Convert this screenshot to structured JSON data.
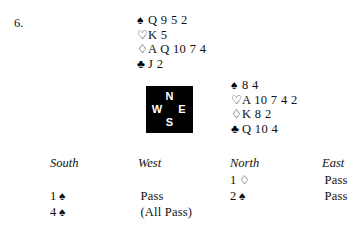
{
  "problem": {
    "number": "6."
  },
  "suits": {
    "spade": "♠",
    "heart": "♡",
    "diamond": "♢",
    "club": "♣"
  },
  "hands": {
    "north": {
      "position_label": "North",
      "rows": [
        {
          "suit_name": "spade-symbol",
          "symbol": "♠",
          "cards": "Q 9 5 2"
        },
        {
          "suit_name": "heart-symbol",
          "symbol": "♡",
          "cards": "K 5"
        },
        {
          "suit_name": "diamond-symbol",
          "symbol": "♢",
          "cards": "A Q 10 7 4"
        },
        {
          "suit_name": "club-symbol",
          "symbol": "♣",
          "cards": "J 2"
        }
      ]
    },
    "east": {
      "position_label": "East",
      "rows": [
        {
          "suit_name": "spade-symbol",
          "symbol": "♠",
          "cards": "8 4"
        },
        {
          "suit_name": "heart-symbol",
          "symbol": "♡",
          "cards": "A 10 7 4 2"
        },
        {
          "suit_name": "diamond-symbol",
          "symbol": "♢",
          "cards": "K 8 2"
        },
        {
          "suit_name": "club-symbol",
          "symbol": "♣",
          "cards": "Q 10 4"
        }
      ]
    }
  },
  "compass": {
    "north": "N",
    "west": "W",
    "east": "E",
    "south": "S",
    "background_color": "#000000",
    "letter_color": "#ffffff"
  },
  "bidding": {
    "headers": {
      "south": "South",
      "west": "West",
      "north": "North",
      "east": "East"
    },
    "rows": [
      {
        "south": {
          "level": "",
          "suit": "",
          "text": ""
        },
        "west": {
          "level": "",
          "suit": "",
          "text": ""
        },
        "north": {
          "level": "1",
          "suit": "♢",
          "text": ""
        },
        "east": {
          "level": "",
          "suit": "",
          "text": "Pass"
        }
      },
      {
        "south": {
          "level": "1",
          "suit": "♠",
          "text": ""
        },
        "west": {
          "level": "",
          "suit": "",
          "text": "Pass"
        },
        "north": {
          "level": "2",
          "suit": "♠",
          "text": ""
        },
        "east": {
          "level": "",
          "suit": "",
          "text": "Pass"
        }
      },
      {
        "south": {
          "level": "4",
          "suit": "♠",
          "text": ""
        },
        "west": {
          "level": "",
          "suit": "",
          "text": "(All Pass)"
        },
        "north": {
          "level": "",
          "suit": "",
          "text": ""
        },
        "east": {
          "level": "",
          "suit": "",
          "text": ""
        }
      }
    ]
  }
}
